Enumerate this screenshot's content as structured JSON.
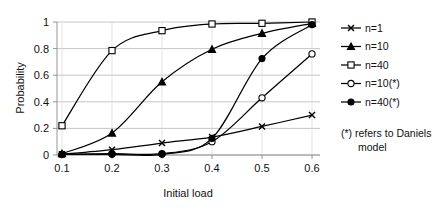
{
  "chart_data": {
    "type": "line",
    "title": "",
    "xlabel": "Initial load",
    "ylabel": "Probability",
    "categories": [
      "0.1",
      "0.2",
      "0.3",
      "0.4",
      "0.5",
      "0.6"
    ],
    "x": [
      0.1,
      0.2,
      0.3,
      0.4,
      0.5,
      0.6
    ],
    "xlim": [
      0.1,
      0.6
    ],
    "ylim": [
      0,
      1
    ],
    "yticks": [
      "0",
      "0.2",
      "0.4",
      "0.6",
      "0.8",
      "1"
    ],
    "ytick_values": [
      0,
      0.2,
      0.4,
      0.6,
      0.8,
      1
    ],
    "xticks": [
      "0.1",
      "0.2",
      "0.3",
      "0.4",
      "0.5",
      "0.6"
    ],
    "grid": "horizontal",
    "legend_position": "right",
    "note": "(*) refers to Daniels model",
    "series": [
      {
        "name": "n=1",
        "marker": "cross",
        "values": [
          0.005,
          0.04,
          0.09,
          0.135,
          0.215,
          0.3
        ]
      },
      {
        "name": "n=10",
        "marker": "triangle-filled",
        "values": [
          0.01,
          0.165,
          0.55,
          0.795,
          0.915,
          0.99
        ]
      },
      {
        "name": "n=40",
        "marker": "square-open",
        "values": [
          0.22,
          0.785,
          0.935,
          0.985,
          0.99,
          1.0
        ]
      },
      {
        "name": "n=10(*)",
        "marker": "circle-open",
        "values": [
          0.005,
          0.01,
          0.01,
          0.1,
          0.43,
          0.76
        ]
      },
      {
        "name": "n=40(*)",
        "marker": "circle-filled",
        "values": [
          0.005,
          0.005,
          0.005,
          0.125,
          0.725,
          0.98
        ]
      }
    ],
    "colors": {
      "line": "#000000",
      "grid": "#b8b8b8",
      "axis": "#8a8a8a",
      "text": "#111111",
      "background": "#ffffff"
    }
  },
  "legend": {
    "entries": [
      {
        "label": "n=1"
      },
      {
        "label": "n=10"
      },
      {
        "label": "n=40"
      },
      {
        "label": "n=10(*)"
      },
      {
        "label": "n=40(*)"
      }
    ],
    "note_line_1": "(*) refers to Daniels",
    "note_line_2": "model"
  },
  "axes": {
    "y_title": "Probability",
    "x_title": "Initial load",
    "y_tick_labels": [
      "1",
      "0.8",
      "0.6",
      "0.4",
      "0.2",
      "0"
    ],
    "x_tick_labels": [
      "0.1",
      "0.2",
      "0.3",
      "0.4",
      "0.5",
      "0.6"
    ]
  }
}
